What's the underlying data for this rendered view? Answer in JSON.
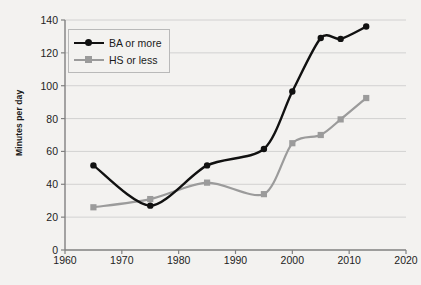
{
  "chart_data": {
    "type": "line",
    "title": "",
    "subtitle": "",
    "xlabel": "",
    "ylabel": "Minutes per day",
    "xlim": [
      1960,
      2020
    ],
    "ylim": [
      0,
      140
    ],
    "xticks": [
      1960,
      1970,
      1980,
      1990,
      2000,
      2010,
      2020
    ],
    "yticks": [
      0,
      20,
      40,
      60,
      80,
      100,
      120,
      140
    ],
    "grid": "horizontal",
    "legend_position": "top-left",
    "series": [
      {
        "name": "BA or more",
        "color": "#111111",
        "marker": "circle",
        "x": [
          1965,
          1975,
          1985,
          1995,
          2000,
          2005,
          2008.5,
          2013
        ],
        "values": [
          51.5,
          27,
          51.5,
          61.5,
          96.5,
          129,
          128.5,
          136
        ]
      },
      {
        "name": "HS or less",
        "color": "#9b9b9b",
        "marker": "square",
        "x": [
          1965,
          1975,
          1985,
          1995,
          2000,
          2005,
          2008.5,
          2013
        ],
        "values": [
          26,
          31,
          41,
          34,
          65,
          70,
          79.5,
          92.5
        ]
      }
    ]
  },
  "axes": {
    "y_title": "Minutes per day",
    "y_tick_labels": [
      "140",
      "120",
      "100",
      "80",
      "60",
      "40",
      "20",
      "0"
    ],
    "x_tick_labels": [
      "1960",
      "1970",
      "1980",
      "1990",
      "2000",
      "2010",
      "2020"
    ]
  },
  "legend": {
    "items": [
      {
        "label": "BA or more",
        "color": "#111111",
        "marker": "circle"
      },
      {
        "label": "HS or less",
        "color": "#9b9b9b",
        "marker": "square"
      }
    ]
  },
  "colors": {
    "background": "#f3f2f0",
    "axis": "#808080",
    "grid": "#c9c9c9",
    "series_primary": "#111111",
    "series_secondary": "#9b9b9b"
  }
}
